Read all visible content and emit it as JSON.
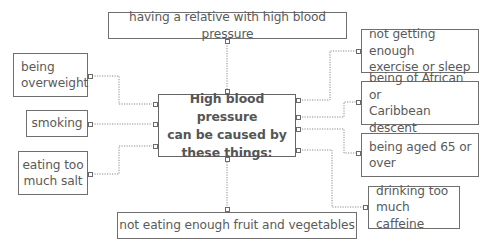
{
  "diagram": {
    "type": "mind-map",
    "central": {
      "label": "High blood pressure can be caused by these things:",
      "lines": [
        "High blood pressure",
        "can be caused by",
        "these things:"
      ]
    },
    "causes": {
      "top": {
        "label": "having a relative with high blood pressure"
      },
      "bottom": {
        "label": "not eating enough fruit and vegetables"
      },
      "left": [
        {
          "label": "being overweight",
          "lines": [
            "being",
            "overweight"
          ]
        },
        {
          "label": "smoking",
          "lines": [
            "smoking"
          ]
        },
        {
          "label": "eating too much salt",
          "lines": [
            "eating too",
            "much salt"
          ]
        }
      ],
      "right": [
        {
          "label": "not getting enough exercise or sleep",
          "lines": [
            "not getting enough",
            "exercise or sleep"
          ]
        },
        {
          "label": "being of African or Caribbean descent",
          "lines": [
            "being of African or",
            "Caribbean descent"
          ]
        },
        {
          "label": "being aged 65 or over",
          "lines": [
            "being aged 65 or",
            "over"
          ]
        },
        {
          "label": "drinking too much caffeine",
          "lines": [
            "drinking too",
            "much caffeine"
          ]
        }
      ]
    },
    "style": {
      "border_color": "#6f6f6f",
      "text_color": "#5a5a5a",
      "connector_style": "dotted",
      "connector_color": "#8a8a8a"
    }
  }
}
